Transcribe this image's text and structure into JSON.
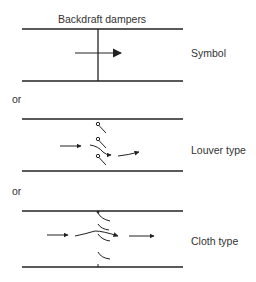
{
  "diagram": {
    "title": "Backdraft dampers",
    "panels": [
      {
        "label": "Symbol"
      },
      {
        "separator": "or",
        "label": "Louver type"
      },
      {
        "separator": "or",
        "label": "Cloth type"
      }
    ],
    "colors": {
      "line": "#222222",
      "text": "#333333",
      "background": "#ffffff"
    }
  }
}
